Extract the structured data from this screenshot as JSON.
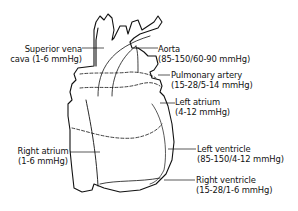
{
  "diagram": {
    "labels": {
      "superior_vena_cava": {
        "line1": "Superior vena",
        "line2": "cava (1-6 mmHg)"
      },
      "aorta": {
        "line1": "Aorta",
        "line2": "(85-150/60-90 mmHg)"
      },
      "pulmonary_artery": {
        "line1": "Pulmonary artery",
        "line2": "(15-28/5-14 mmHg)"
      },
      "left_atrium": {
        "line1": "Left atrium",
        "line2": "(4-12 mmHg)"
      },
      "right_atrium": {
        "line1": "Right atrium",
        "line2": "(1-6 mmHg)"
      },
      "left_ventricle": {
        "line1": "Left ventricle",
        "line2": "(85-150/4-12 mmHg)"
      },
      "right_ventricle": {
        "line1": "Right ventricle",
        "line2": "(15-28/1-6 mmHg)"
      }
    },
    "colors": {
      "ink": "#111111",
      "background": "#ffffff"
    }
  }
}
